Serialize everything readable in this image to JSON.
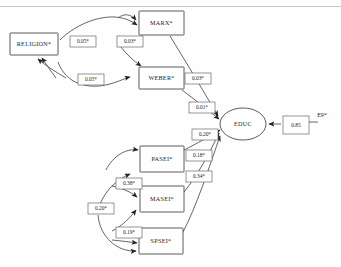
{
  "diagram": {
    "type": "path-diagram",
    "title": "",
    "nodes": [
      {
        "id": "religion",
        "label": "RELIGION*",
        "shape": "rect",
        "x": 10,
        "y": 33,
        "w": 48,
        "h": 22
      },
      {
        "id": "marx",
        "label": "MARX*",
        "shape": "rect",
        "x": 139,
        "y": 11,
        "w": 45,
        "h": 24
      },
      {
        "id": "weber",
        "label": "WEBER*",
        "shape": "rect",
        "x": 139,
        "y": 67,
        "w": 45,
        "h": 22
      },
      {
        "id": "educ",
        "label": "EDUC",
        "shape": "ellipse",
        "cx": 243,
        "cy": 124,
        "rx": 23,
        "ry": 16
      },
      {
        "id": "pasei",
        "label": "PASEI*",
        "shape": "rect",
        "x": 140,
        "y": 146,
        "w": 44,
        "h": 26
      },
      {
        "id": "masei",
        "label": "MASEI*",
        "shape": "rect",
        "x": 140,
        "y": 186,
        "w": 44,
        "h": 26
      },
      {
        "id": "spsei",
        "label": "SPSEI*",
        "shape": "rect",
        "x": 139,
        "y": 228,
        "w": 44,
        "h": 26
      },
      {
        "id": "e9",
        "label": "E9*",
        "shape": "text",
        "x": 322,
        "y": 116
      }
    ],
    "coefficients": [
      {
        "id": "c-religion-marx",
        "value": "0.05*",
        "x": 70,
        "y": 36,
        "w": 26,
        "h": 11
      },
      {
        "id": "c-marx-weber",
        "value": "0.03*",
        "x": 117,
        "y": 36,
        "w": 26,
        "h": 11
      },
      {
        "id": "c-religion-weber",
        "value": "0.05*",
        "x": 78,
        "y": 74,
        "w": 26,
        "h": 11
      },
      {
        "id": "c-weber-educ",
        "value": "0.03*",
        "x": 185,
        "y": 73,
        "w": 26,
        "h": 11
      },
      {
        "id": "c-marx-educ",
        "value": "0.01*",
        "x": 189,
        "y": 102,
        "w": 26,
        "h": 11
      },
      {
        "id": "c-pasei-educ",
        "value": "0.20*",
        "x": 192,
        "y": 129,
        "w": 26,
        "h": 11
      },
      {
        "id": "c-masei-educ",
        "value": "0.18*",
        "x": 186,
        "y": 150,
        "w": 26,
        "h": 11
      },
      {
        "id": "c-spsei-educ",
        "value": "0.34*",
        "x": 186,
        "y": 171,
        "w": 26,
        "h": 11
      },
      {
        "id": "c-pasei-masei",
        "value": "0.38*",
        "x": 116,
        "y": 178,
        "w": 26,
        "h": 11
      },
      {
        "id": "c-pasei-spsei",
        "value": "0.20*",
        "x": 88,
        "y": 203,
        "w": 26,
        "h": 11
      },
      {
        "id": "c-masei-spsei",
        "value": "0.19*",
        "x": 116,
        "y": 227,
        "w": 26,
        "h": 11
      },
      {
        "id": "c-e9-educ",
        "value": "0.85",
        "x": 283,
        "y": 116,
        "w": 26,
        "h": 18
      }
    ]
  }
}
